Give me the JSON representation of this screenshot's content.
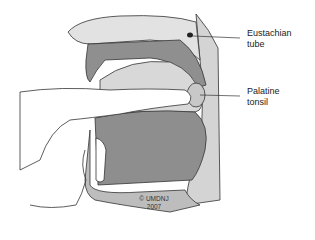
{
  "labels": {
    "eustachian": {
      "line1": "Eustachian",
      "line2": "tube"
    },
    "palatine": {
      "line1": "Palatine",
      "line2": "tonsil"
    }
  },
  "copyright": {
    "line1": "© UMDNJ",
    "line2": "2007"
  },
  "colors": {
    "dark_tissue": "#8a8a8a",
    "mid_tissue": "#b8b8b8",
    "light_tissue": "#dcdcdc",
    "outline": "#333333"
  }
}
